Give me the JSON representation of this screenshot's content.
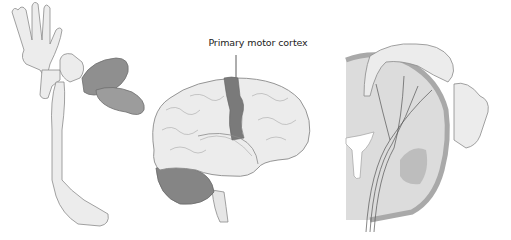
{
  "figure": {
    "panels": [
      {
        "id": "homunculus",
        "description": "Motor homunculus figure with large hand, lips and tongue"
      },
      {
        "id": "lateral-brain",
        "description": "Lateral view of brain with primary motor cortex highlighted"
      },
      {
        "id": "coronal-section",
        "description": "Coronal section of motor cortex with homunculus mapped along cortex"
      }
    ],
    "annotation": {
      "label": "Primary motor cortex"
    },
    "colors": {
      "background": "#ffffff",
      "outline": "#8a8a8a",
      "skin": "#ececec",
      "highlight": "#7a7a7a",
      "cerebellum": "#858585",
      "grey_matter": "#a9a9a9",
      "white_matter": "#dcdcdc"
    }
  }
}
